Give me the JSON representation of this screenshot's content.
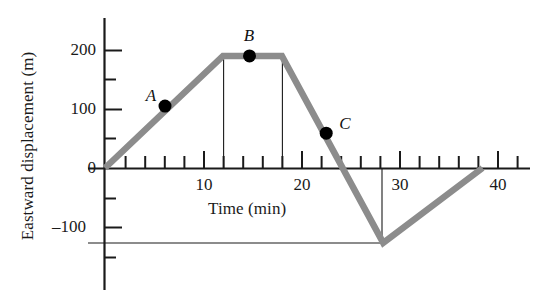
{
  "chart_data": {
    "type": "line",
    "title": "",
    "xlabel": "Time (min)",
    "ylabel": "Eastward displacement (m)",
    "xlim": [
      -1.5,
      43
    ],
    "ylim": [
      -260,
      245
    ],
    "grid": false,
    "legend": "none",
    "xticks": [
      0,
      2,
      4,
      6,
      8,
      10,
      12,
      14,
      16,
      18,
      20,
      22,
      24,
      26,
      28,
      30,
      32,
      34,
      36,
      38,
      40,
      42
    ],
    "xtick_labels": [
      "10",
      "20",
      "30",
      "40"
    ],
    "xtick_label_values": [
      10,
      20,
      30,
      40
    ],
    "yticks": [
      -200,
      -150,
      -100,
      -50,
      0,
      50,
      100,
      150,
      200
    ],
    "ytick_labels": [
      "200",
      "100",
      "0",
      "–100"
    ],
    "ytick_label_values": [
      200,
      100,
      0,
      -100
    ],
    "series": [
      {
        "name": "displacement",
        "color": "#8c8c8c",
        "x": [
          0,
          12,
          18,
          28.3,
          38.4
        ],
        "y": [
          0,
          190,
          190,
          -127,
          0
        ]
      }
    ],
    "annotations": [
      {
        "label": "A",
        "x": 6.1,
        "y": 105,
        "label_offset": "upper-left"
      },
      {
        "label": "B",
        "x": 14.7,
        "y": 190,
        "label_offset": "above"
      },
      {
        "label": "C",
        "x": 22.5,
        "y": 59,
        "label_offset": "upper-right"
      }
    ],
    "guide_lines": [
      {
        "type": "vertical",
        "x": 12,
        "y_from": 0,
        "y_to": 190
      },
      {
        "type": "vertical",
        "x": 18,
        "y_from": 0,
        "y_to": 190
      },
      {
        "type": "vertical",
        "x": 28.3,
        "y_from": 0,
        "y_to": -127
      },
      {
        "type": "horizontal",
        "y": -127,
        "x_from": -1.5,
        "x_to": 28.3
      }
    ]
  },
  "axes": {
    "y_title": "Eastward displacement (m)",
    "x_title": "Time (min)",
    "y_labels": [
      {
        "text": "200",
        "value": 200
      },
      {
        "text": "100",
        "value": 100
      },
      {
        "text": "0",
        "value": 0
      },
      {
        "text": "–100",
        "value": -100
      }
    ],
    "x_labels": [
      {
        "text": "10",
        "value": 10
      },
      {
        "text": "20",
        "value": 20
      },
      {
        "text": "30",
        "value": 30
      },
      {
        "text": "40",
        "value": 40
      }
    ]
  },
  "points": [
    {
      "name": "A",
      "label": "A"
    },
    {
      "name": "B",
      "label": "B"
    },
    {
      "name": "C",
      "label": "C"
    }
  ],
  "style": {
    "curve_color": "#8c8c8c",
    "axis_color": "#1a1a1a",
    "marker_color": "#000000",
    "background": "#ffffff"
  }
}
